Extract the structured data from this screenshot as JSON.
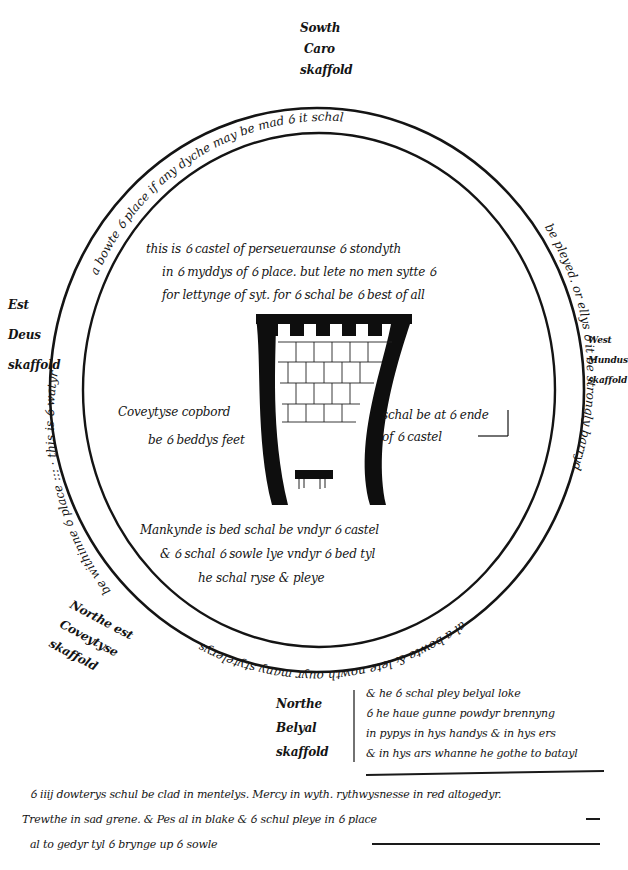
{
  "document": {
    "title": "Stage plan — The Castle of Perseverance",
    "ink_color": "#141414",
    "paper_color": "#ffffff"
  },
  "scaffolds": {
    "south": {
      "lines": [
        "Sowth",
        "Caro",
        "skaffold"
      ]
    },
    "east": {
      "lines": [
        "Est",
        "Deus",
        "skaffold"
      ]
    },
    "west": {
      "lines": [
        "West",
        "Mundus",
        "skaffold"
      ]
    },
    "northeast": {
      "lines": [
        "Northe est",
        "Coveytyse",
        "skaffold"
      ]
    },
    "north": {
      "lines": [
        "Northe",
        "Belyal",
        "skaffold"
      ]
    }
  },
  "ring_text": {
    "top": "this is the watyr a bowte the place if any dyche may be mad ther it schal be pleyed, or ellys that it be strongly barryd al a bowte & lete nowth ouyr many stytelerys be withinne the place",
    "top_visible": "a bowte ỽ place if any dyche may be mad ỽ it schal",
    "right_visible": "be pleyed. or ellys ỽ it be strongly barryd",
    "bottom_visible": "al a bowte & lete nowth ouyr many stytelerys",
    "left_visible": "be withinne ỽ place ::: · this is ỽ watyr"
  },
  "castle_notes": {
    "top": [
      "this is ỽ castel of perseueraunse ỽ stondyth",
      "in ỽ myddys of ỽ place. but lete no men sytte ỽ",
      "for lettynge of syt. for ỽ schal be ỽ best of all"
    ],
    "left": [
      "Coveytyse copbord",
      "be ỽ beddys feet"
    ],
    "right": [
      "schal be at ỽ ende",
      "of ỽ castel"
    ],
    "bottom": [
      "Mankynde is bed schal be vndyr ỽ castel",
      "& ỽ schal ỽ sowle lye vndyr ỽ bed tyl",
      "he schal ryse & pleye"
    ]
  },
  "side_note": {
    "lines": [
      "& he ỽ schal pley belyal loke",
      "ỽ he haue gunne powdyr brennyng",
      "in pypys in hys handys & in hys ers",
      "& in hys ars whanne he gothe to batayl"
    ]
  },
  "footer_note": {
    "lines": [
      "ỽ iiij dowterys schul be clad in mentelys. Mercy in wyth. rythwysnesse in red altogedyr.",
      "Trewthe in sad grene. & Pes al in blake & ỽ schul pleye in ỽ place",
      "al to gedyr tyl ỽ brynge up ỽ sowle"
    ]
  },
  "castle_drawing": {
    "battlements": 5,
    "brick_rows": 4
  }
}
